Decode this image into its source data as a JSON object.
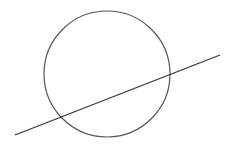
{
  "diagram": {
    "type": "circle-with-secant-line",
    "canvas": {
      "width": 234,
      "height": 149,
      "background": "#ffffff"
    },
    "circle": {
      "cx": 107,
      "cy": 74,
      "r": 63,
      "stroke": "#555555",
      "stroke_width": 1.2,
      "fill": "none"
    },
    "line": {
      "x1": 15,
      "y1": 135,
      "x2": 220,
      "y2": 55,
      "stroke": "#333333",
      "stroke_width": 1.2
    },
    "labels": []
  }
}
